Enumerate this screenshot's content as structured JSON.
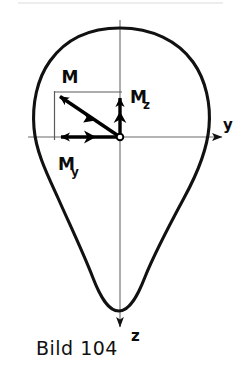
{
  "figure": {
    "caption": "Bild 104",
    "caption_number": "104",
    "caption_prefix": "Bild",
    "colors": {
      "outline": "#111111",
      "vector": "#000000",
      "axis": "#555555",
      "background": "#ffffff",
      "text": "#111111"
    },
    "axes": [
      {
        "id": "y",
        "label": "y",
        "direction": "right",
        "label_x": 228,
        "label_y": 130
      },
      {
        "id": "z",
        "label": "z",
        "direction": "down",
        "label_x": 131,
        "label_y": 340
      }
    ],
    "origin": {
      "label": "",
      "x": 120,
      "y": 137
    },
    "vectors": [
      {
        "id": "M",
        "label": "M",
        "subscript": "",
        "direction": "up-left",
        "from_x": 120,
        "from_y": 137,
        "to_x": 55,
        "to_y": 93,
        "label_x": 70,
        "label_y": 83,
        "arrowheads": 2
      },
      {
        "id": "My",
        "label": "M",
        "subscript": "y",
        "direction": "left",
        "from_x": 120,
        "from_y": 137,
        "to_x": 55,
        "to_y": 137,
        "label_x": 58,
        "label_y": 170,
        "arrowheads": 2
      },
      {
        "id": "Mz",
        "label": "M",
        "subscript": "z",
        "direction": "up",
        "from_x": 120,
        "from_y": 137,
        "to_x": 120,
        "to_y": 93,
        "label_x": 130,
        "label_y": 103,
        "arrowheads": 2
      }
    ],
    "construction_lines": [
      {
        "id": "top-horizontal",
        "x1": 55,
        "y1": 92,
        "x2": 122,
        "y2": 92
      },
      {
        "id": "left-vertical",
        "x1": 55,
        "y1": 92,
        "x2": 55,
        "y2": 139
      }
    ],
    "shape": {
      "name": "cross-section-outline",
      "top_y": 28,
      "bottom_y": 311,
      "left_x": 33,
      "right_x": 209
    }
  }
}
